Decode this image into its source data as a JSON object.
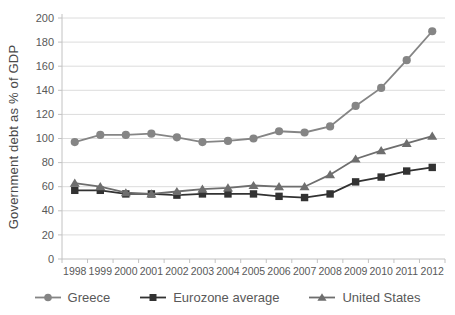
{
  "chart_data": {
    "type": "line",
    "title": "",
    "xlabel": "",
    "ylabel": "Government debt as % of GDP",
    "ylim": [
      0,
      200
    ],
    "ytick_step": 20,
    "grid": "horizontal",
    "legend_position": "bottom",
    "categories": [
      "1998",
      "1999",
      "2000",
      "2001",
      "2002",
      "2003",
      "2004",
      "2005",
      "2006",
      "2007",
      "2008",
      "2009",
      "2010",
      "2011",
      "2012"
    ],
    "series": [
      {
        "name": "Greece",
        "marker": "circle",
        "color": "#858585",
        "values": [
          97,
          103,
          103,
          104,
          101,
          97,
          98,
          100,
          106,
          105,
          110,
          127,
          142,
          165,
          189
        ]
      },
      {
        "name": "Eurozone average",
        "marker": "square",
        "color": "#323232",
        "values": [
          57,
          57,
          54,
          54,
          53,
          54,
          54,
          54,
          52,
          51,
          54,
          64,
          68,
          73,
          76
        ]
      },
      {
        "name": "United States",
        "marker": "triangle",
        "color": "#6e6e6e",
        "values": [
          63,
          60,
          55,
          54,
          56,
          58,
          59,
          61,
          60,
          60,
          70,
          83,
          90,
          96,
          102
        ]
      }
    ]
  },
  "colors": {
    "background": "#ffffff",
    "gridline": "#dcdcdc",
    "axis": "#c2c2c2",
    "tick_text": "#595959",
    "axis_title_text": "#4a4a4a"
  }
}
